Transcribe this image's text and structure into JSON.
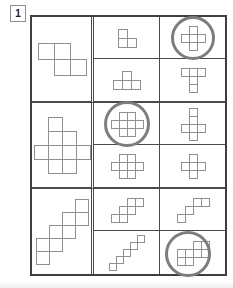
{
  "page": {
    "label": "1"
  },
  "colors": {
    "paper": "#ffffff",
    "grid_line": "#4a4a4a",
    "shape_line": "#909090",
    "circle_mark": "#7d7d7d"
  },
  "puzzle": {
    "rows": [
      {
        "target": {
          "name": "s-tetromino",
          "unit": 16,
          "cols": 3,
          "rows": 2,
          "cells": [
            [
              0,
              0
            ],
            [
              1,
              0
            ],
            [
              1,
              1
            ],
            [
              2,
              1
            ]
          ],
          "circled": false
        },
        "options": [
          {
            "name": "l-tromino",
            "unit": 9,
            "cols": 2,
            "rows": 2,
            "cells": [
              [
                0,
                0
              ],
              [
                0,
                1
              ],
              [
                1,
                1
              ]
            ],
            "circled": false
          },
          {
            "name": "t-tetromino",
            "unit": 9,
            "cols": 3,
            "rows": 2,
            "cells": [
              [
                1,
                0
              ],
              [
                0,
                1
              ],
              [
                1,
                1
              ],
              [
                2,
                1
              ]
            ],
            "circled": false
          },
          {
            "name": "plus-pentomino",
            "unit": 8,
            "cols": 3,
            "rows": 3,
            "cells": [
              [
                1,
                0
              ],
              [
                0,
                1
              ],
              [
                1,
                1
              ],
              [
                2,
                1
              ],
              [
                1,
                2
              ]
            ],
            "circled": true,
            "circle_d": 38
          },
          {
            "name": "t-pentomino",
            "unit": 8,
            "cols": 3,
            "rows": 3,
            "cells": [
              [
                0,
                0
              ],
              [
                1,
                0
              ],
              [
                2,
                0
              ],
              [
                1,
                1
              ],
              [
                1,
                2
              ]
            ],
            "circled": false
          }
        ]
      },
      {
        "target": {
          "name": "wide-cross-nonomino",
          "unit": 14,
          "cols": 4,
          "rows": 4,
          "cells": [
            [
              1,
              0
            ],
            [
              1,
              1
            ],
            [
              2,
              1
            ],
            [
              0,
              2
            ],
            [
              1,
              2
            ],
            [
              2,
              2
            ],
            [
              3,
              2
            ],
            [
              1,
              3
            ],
            [
              2,
              3
            ]
          ],
          "circled": false
        },
        "options": [
          {
            "name": "wide-plus-octomino",
            "unit": 8,
            "cols": 4,
            "rows": 3,
            "cells": [
              [
                1,
                0
              ],
              [
                2,
                0
              ],
              [
                0,
                1
              ],
              [
                1,
                1
              ],
              [
                2,
                1
              ],
              [
                3,
                1
              ],
              [
                1,
                2
              ],
              [
                2,
                2
              ]
            ],
            "circled": true,
            "circle_d": 40
          },
          {
            "name": "wide-plus-octomino",
            "unit": 8,
            "cols": 4,
            "rows": 3,
            "cells": [
              [
                1,
                0
              ],
              [
                2,
                0
              ],
              [
                0,
                1
              ],
              [
                1,
                1
              ],
              [
                2,
                1
              ],
              [
                3,
                1
              ],
              [
                1,
                2
              ],
              [
                2,
                2
              ]
            ],
            "circled": false
          },
          {
            "name": "cross-cube-net",
            "unit": 8,
            "cols": 3,
            "rows": 4,
            "cells": [
              [
                1,
                0
              ],
              [
                1,
                1
              ],
              [
                0,
                2
              ],
              [
                1,
                2
              ],
              [
                2,
                2
              ],
              [
                1,
                3
              ]
            ],
            "circled": false
          },
          {
            "name": "plus-pentomino",
            "unit": 8,
            "cols": 3,
            "rows": 3,
            "cells": [
              [
                1,
                0
              ],
              [
                0,
                1
              ],
              [
                1,
                1
              ],
              [
                2,
                1
              ],
              [
                1,
                2
              ]
            ],
            "circled": false
          }
        ]
      },
      {
        "target": {
          "name": "thick-staircase-octomino",
          "unit": 13,
          "cols": 4,
          "rows": 5,
          "cells": [
            [
              3,
              0
            ],
            [
              2,
              1
            ],
            [
              3,
              1
            ],
            [
              1,
              2
            ],
            [
              2,
              2
            ],
            [
              0,
              3
            ],
            [
              1,
              3
            ],
            [
              0,
              4
            ]
          ],
          "circled": false
        },
        "options": [
          {
            "name": "step-pairs-staircase",
            "unit": 8,
            "cols": 4,
            "rows": 3,
            "cells": [
              [
                2,
                0
              ],
              [
                3,
                0
              ],
              [
                1,
                1
              ],
              [
                2,
                1
              ],
              [
                0,
                2
              ],
              [
                1,
                2
              ]
            ],
            "circled": false
          },
          {
            "name": "diagonal-staircase",
            "unit": 7,
            "cols": 5,
            "rows": 5,
            "cells": [
              [
                4,
                0
              ],
              [
                3,
                1
              ],
              [
                2,
                2
              ],
              [
                1,
                3
              ],
              [
                0,
                4
              ]
            ],
            "circled": false
          },
          {
            "name": "small-staircase",
            "unit": 8,
            "cols": 4,
            "rows": 3,
            "cells": [
              [
                2,
                0
              ],
              [
                3,
                0
              ],
              [
                1,
                1
              ],
              [
                0,
                2
              ]
            ],
            "circled": false
          },
          {
            "name": "double-block-staircase",
            "unit": 8,
            "cols": 4,
            "rows": 3,
            "cells": [
              [
                2,
                0
              ],
              [
                3,
                0
              ],
              [
                2,
                1
              ],
              [
                3,
                1
              ],
              [
                0,
                1
              ],
              [
                1,
                1
              ],
              [
                0,
                2
              ],
              [
                1,
                2
              ]
            ],
            "circled": true,
            "circle_d": 40,
            "circle_dx": -5,
            "circle_dy": 1
          }
        ]
      }
    ]
  }
}
